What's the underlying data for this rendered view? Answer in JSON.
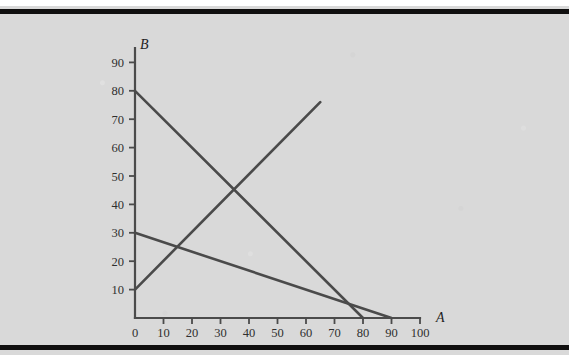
{
  "figure": {
    "background_color": "#d9d9d9",
    "page_color": "#ffffff",
    "rule_color": "#100f0f",
    "line_color": "#4a4a4a",
    "axis_color": "#4b4b4b"
  },
  "chart_data": {
    "type": "line",
    "title": "",
    "subtitle": "",
    "xlabel": "A",
    "ylabel": "B",
    "xlim": [
      0,
      100
    ],
    "ylim": [
      0,
      95
    ],
    "xticks": [
      0,
      10,
      20,
      30,
      40,
      50,
      60,
      70,
      80,
      90,
      100
    ],
    "xtick_labels": [
      "0",
      "10",
      "20",
      "30",
      "40",
      "50",
      "60",
      "70",
      "80",
      "90",
      "100"
    ],
    "yticks": [
      10,
      20,
      30,
      40,
      50,
      60,
      70,
      80,
      90
    ],
    "ytick_labels": [
      "10",
      "20",
      "30",
      "40",
      "50",
      "60",
      "70",
      "80",
      "90"
    ],
    "grid": false,
    "legend": null,
    "legend_position": "none",
    "series": [
      {
        "name": "steep-declining-line",
        "type": "line",
        "x": [
          0,
          80
        ],
        "y": [
          80,
          0
        ],
        "slope": -1,
        "intercept": 80,
        "color": "#4a4a4a"
      },
      {
        "name": "shallow-declining-line",
        "type": "line",
        "x": [
          0,
          90
        ],
        "y": [
          30,
          0
        ],
        "slope": -0.3333,
        "intercept": 30,
        "color": "#4a4a4a"
      },
      {
        "name": "rising-line",
        "type": "line",
        "x": [
          0,
          65
        ],
        "y": [
          10,
          76
        ],
        "slope": 1.015,
        "intercept": 10,
        "color": "#4a4a4a"
      }
    ],
    "annotations": [
      {
        "name": "intersection-steep-rising",
        "x": 34,
        "y": 45
      },
      {
        "name": "intersection-shallow-rising",
        "x": 14,
        "y": 25
      }
    ]
  }
}
